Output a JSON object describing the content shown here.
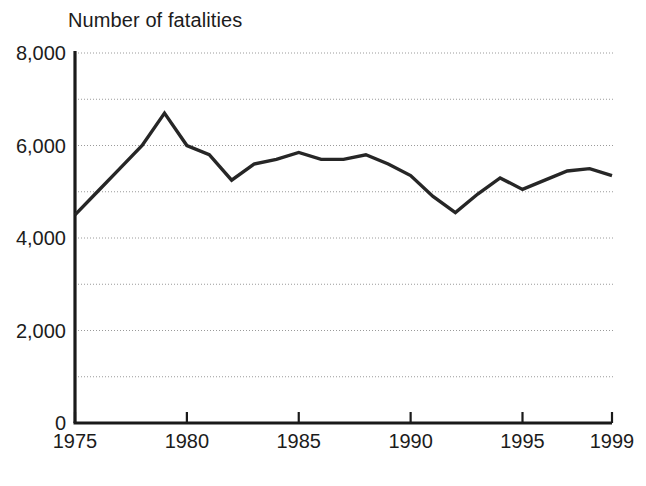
{
  "chart_data": {
    "type": "line",
    "title": "Number of fatalities",
    "xlabel": "",
    "ylabel": "",
    "x": [
      1975,
      1976,
      1977,
      1978,
      1979,
      1980,
      1981,
      1982,
      1983,
      1984,
      1985,
      1986,
      1987,
      1988,
      1989,
      1990,
      1991,
      1992,
      1993,
      1994,
      1995,
      1996,
      1997,
      1998,
      1999
    ],
    "values": [
      4500,
      5000,
      5500,
      6000,
      6700,
      6000,
      5800,
      5250,
      5600,
      5700,
      5850,
      5700,
      5700,
      5800,
      5600,
      5350,
      4900,
      4550,
      4950,
      5300,
      5050,
      5250,
      5450,
      5500,
      5350
    ],
    "series": [
      {
        "name": "Fatalities",
        "values": [
          4500,
          5000,
          5500,
          6000,
          6700,
          6000,
          5800,
          5250,
          5600,
          5700,
          5850,
          5700,
          5700,
          5800,
          5600,
          5350,
          4900,
          4550,
          4950,
          5300,
          5050,
          5250,
          5450,
          5500,
          5350
        ]
      }
    ],
    "xlim": [
      1975,
      1999
    ],
    "ylim": [
      0,
      8000
    ],
    "ytick_labels": [
      "0",
      "2,000",
      "4,000",
      "6,000",
      "8,000"
    ],
    "ytick_values": [
      0,
      2000,
      4000,
      6000,
      8000
    ],
    "yminor_values": [
      1000,
      3000,
      5000,
      7000
    ],
    "xtick_labels": [
      "1975",
      "1980",
      "1985",
      "1990",
      "1995",
      "1999"
    ],
    "xtick_values": [
      1975,
      1980,
      1985,
      1990,
      1995,
      1999
    ],
    "grid": "horizontal-dotted",
    "legend": "none",
    "line_color": "#262626",
    "axis_color": "#1a1a1a",
    "grid_color": "#9a9a9a"
  }
}
